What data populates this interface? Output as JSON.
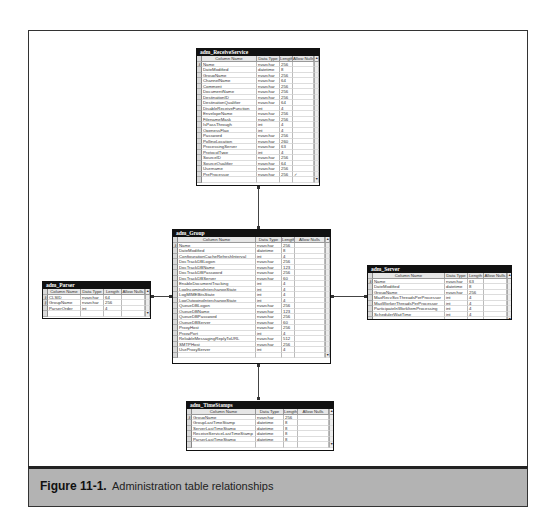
{
  "figure": {
    "label": "Figure 11-1.",
    "caption": "Administration table relationships"
  },
  "column_headers": [
    "Column Name",
    "Data Type",
    "Length",
    "Allow Nulls"
  ],
  "tables": {
    "receive_service": {
      "title": "adm_ReceiveService",
      "rows": [
        {
          "name": "Name",
          "type": "nvarchar",
          "length": "256",
          "nulls": ""
        },
        {
          "name": "DateModified",
          "type": "datetime",
          "length": "8",
          "nulls": ""
        },
        {
          "name": "GroupName",
          "type": "nvarchar",
          "length": "256",
          "nulls": ""
        },
        {
          "name": "ChannelName",
          "type": "nvarchar",
          "length": "64",
          "nulls": ""
        },
        {
          "name": "Comment",
          "type": "nvarchar",
          "length": "256",
          "nulls": ""
        },
        {
          "name": "DocumentName",
          "type": "nvarchar",
          "length": "256",
          "nulls": ""
        },
        {
          "name": "DestinationID",
          "type": "nvarchar",
          "length": "256",
          "nulls": ""
        },
        {
          "name": "DestinationQualifier",
          "type": "nvarchar",
          "length": "64",
          "nulls": ""
        },
        {
          "name": "DisableReceiveFunction",
          "type": "int",
          "length": "4",
          "nulls": ""
        },
        {
          "name": "EnvelopeName",
          "type": "nvarchar",
          "length": "256",
          "nulls": ""
        },
        {
          "name": "FilenameMask",
          "type": "nvarchar",
          "length": "256",
          "nulls": ""
        },
        {
          "name": "IsPassThrough",
          "type": "int",
          "length": "4",
          "nulls": ""
        },
        {
          "name": "OpenessFlag",
          "type": "int",
          "length": "4",
          "nulls": ""
        },
        {
          "name": "Password",
          "type": "nvarchar",
          "length": "256",
          "nulls": ""
        },
        {
          "name": "PollingLocation",
          "type": "nvarchar",
          "length": "260",
          "nulls": ""
        },
        {
          "name": "ProcessingServer",
          "type": "nvarchar",
          "length": "63",
          "nulls": ""
        },
        {
          "name": "ProtocolType",
          "type": "int",
          "length": "4",
          "nulls": ""
        },
        {
          "name": "SourceID",
          "type": "nvarchar",
          "length": "256",
          "nulls": ""
        },
        {
          "name": "SourceQualifier",
          "type": "nvarchar",
          "length": "64",
          "nulls": ""
        },
        {
          "name": "Username",
          "type": "nvarchar",
          "length": "256",
          "nulls": ""
        },
        {
          "name": "PreProcessor",
          "type": "nvarchar",
          "length": "256",
          "nulls": "✓"
        }
      ]
    },
    "group": {
      "title": "adm_Group",
      "rows": [
        {
          "name": "Name",
          "type": "nvarchar",
          "length": "256",
          "nulls": ""
        },
        {
          "name": "DateModified",
          "type": "datetime",
          "length": "8",
          "nulls": ""
        },
        {
          "name": "ConfigurationCacheRefreshInterval",
          "type": "int",
          "length": "4",
          "nulls": ""
        },
        {
          "name": "DocTrackDBLogon",
          "type": "nvarchar",
          "length": "256",
          "nulls": ""
        },
        {
          "name": "DocTrackDBName",
          "type": "nvarchar",
          "length": "123",
          "nulls": ""
        },
        {
          "name": "DocTrackDBPassword",
          "type": "nvarchar",
          "length": "256",
          "nulls": ""
        },
        {
          "name": "DocTrackDBServer",
          "type": "nvarchar",
          "length": "60",
          "nulls": ""
        },
        {
          "name": "EnableDocumentTracking",
          "type": "int",
          "length": "4",
          "nulls": ""
        },
        {
          "name": "LogIncomingInterchangeState",
          "type": "int",
          "length": "4",
          "nulls": ""
        },
        {
          "name": "LogMIMEBitsState",
          "type": "int",
          "length": "4",
          "nulls": ""
        },
        {
          "name": "LogOutgoingInterchangeState",
          "type": "int",
          "length": "4",
          "nulls": ""
        },
        {
          "name": "QueueDBLogon",
          "type": "nvarchar",
          "length": "256",
          "nulls": ""
        },
        {
          "name": "QueueDBName",
          "type": "nvarchar",
          "length": "123",
          "nulls": ""
        },
        {
          "name": "QueueDBPassword",
          "type": "nvarchar",
          "length": "256",
          "nulls": ""
        },
        {
          "name": "QueueDBServer",
          "type": "nvarchar",
          "length": "60",
          "nulls": ""
        },
        {
          "name": "ProxyHost",
          "type": "nvarchar",
          "length": "256",
          "nulls": ""
        },
        {
          "name": "ProxyPort",
          "type": "int",
          "length": "4",
          "nulls": ""
        },
        {
          "name": "ReliableMessagingReplyToURL",
          "type": "nvarchar",
          "length": "512",
          "nulls": ""
        },
        {
          "name": "SMTPHost",
          "type": "nvarchar",
          "length": "256",
          "nulls": ""
        },
        {
          "name": "UseProxyServer",
          "type": "int",
          "length": "4",
          "nulls": ""
        }
      ]
    },
    "parser": {
      "title": "adm_Parser",
      "rows": [
        {
          "name": "CLSID",
          "type": "nvarchar",
          "length": "64",
          "nulls": ""
        },
        {
          "name": "GroupName",
          "type": "nvarchar",
          "length": "256",
          "nulls": ""
        },
        {
          "name": "ParserOrder",
          "type": "int",
          "length": "4",
          "nulls": ""
        }
      ]
    },
    "server": {
      "title": "adm_Server",
      "rows": [
        {
          "name": "Name",
          "type": "nvarchar",
          "length": "63",
          "nulls": ""
        },
        {
          "name": "DateModified",
          "type": "datetime",
          "length": "8",
          "nulls": ""
        },
        {
          "name": "GroupName",
          "type": "nvarchar",
          "length": "256",
          "nulls": ""
        },
        {
          "name": "MaxRecvSvcThreadsPerProcessor",
          "type": "int",
          "length": "4",
          "nulls": ""
        },
        {
          "name": "MaxWorkerThreadsPerProcessor",
          "type": "int",
          "length": "4",
          "nulls": ""
        },
        {
          "name": "ParticipateInWorkItemProcessing",
          "type": "int",
          "length": "4",
          "nulls": ""
        },
        {
          "name": "SchedulerWaitTime",
          "type": "int",
          "length": "4",
          "nulls": ""
        }
      ]
    },
    "timestamps": {
      "title": "adm_TimeStamps",
      "rows": [
        {
          "name": "GroupName",
          "type": "nvarchar",
          "length": "256",
          "nulls": ""
        },
        {
          "name": "GroupLastTimeStamp",
          "type": "datetime",
          "length": "8",
          "nulls": ""
        },
        {
          "name": "ServerLastTimeStamp",
          "type": "datetime",
          "length": "8",
          "nulls": ""
        },
        {
          "name": "ReceiveServiceLastTimeStamp",
          "type": "datetime",
          "length": "8",
          "nulls": ""
        },
        {
          "name": "ParserLastTimeStamp",
          "type": "datetime",
          "length": "8",
          "nulls": ""
        }
      ]
    }
  },
  "relationships": [
    {
      "from": "adm_ReceiveService",
      "to": "adm_Group"
    },
    {
      "from": "adm_Parser",
      "to": "adm_Group"
    },
    {
      "from": "adm_Server",
      "to": "adm_Group"
    },
    {
      "from": "adm_TimeStamps",
      "to": "adm_Group"
    }
  ]
}
